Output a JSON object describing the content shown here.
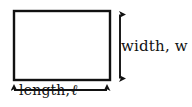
{
  "figure": {
    "kind": "geometry-diagram",
    "background_color": "#ffffff",
    "stroke_color": "#111111",
    "text_color": "#111111"
  },
  "shape": {
    "name": "rectangle",
    "x": 14,
    "y": 11,
    "width": 96,
    "height": 69,
    "stroke_width": 2.4,
    "fill": "#ffffff"
  },
  "dimensions": {
    "width_label": {
      "text": "width, w",
      "orientation": "vertical",
      "arrow": {
        "x": 120,
        "y_start": 13,
        "y_end": 80,
        "double_headed": true
      }
    },
    "length_label": {
      "prefix": "length,",
      "symbol": "ℓ",
      "text": "length, ℓ",
      "orientation": "horizontal",
      "arrow": {
        "y": 90,
        "x_start": 11,
        "x_end": 110,
        "double_headed": true
      }
    }
  }
}
